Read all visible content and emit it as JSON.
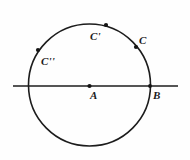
{
  "figure": {
    "kind": "geometry-diagram",
    "canvas": {
      "width": 190,
      "height": 160,
      "background": "#fefefe"
    },
    "stroke_color": "#1c1c1c",
    "label_color": "#1b1b1b",
    "circle": {
      "cx": 89.5,
      "cy": 85,
      "r": 61,
      "stroke_width": 1.6
    },
    "line": {
      "x1": 13,
      "y1": 86,
      "x2": 178,
      "y2": 86,
      "stroke_width": 1.6
    },
    "points": [
      {
        "id": "A",
        "label": "A",
        "x": 89.5,
        "y": 86,
        "dot_r": 2.1,
        "role": "center"
      },
      {
        "id": "B",
        "label": "B",
        "x": 150,
        "y": 86,
        "dot_r": 1.9,
        "role": "intersection"
      },
      {
        "id": "C",
        "label": "C",
        "x": 136,
        "y": 47,
        "dot_r": 2.1,
        "role": "on-circle"
      },
      {
        "id": "Cp",
        "label": "C'",
        "x": 106,
        "y": 25,
        "dot_r": 2.1,
        "role": "on-circle"
      },
      {
        "id": "Cpp",
        "label": "C''",
        "x": 38,
        "y": 50,
        "dot_r": 2.1,
        "role": "on-circle"
      }
    ],
    "labels": {
      "A": "A",
      "B": "B",
      "C": "C",
      "C_prime": "C'",
      "C_double_prime": "C''"
    }
  }
}
